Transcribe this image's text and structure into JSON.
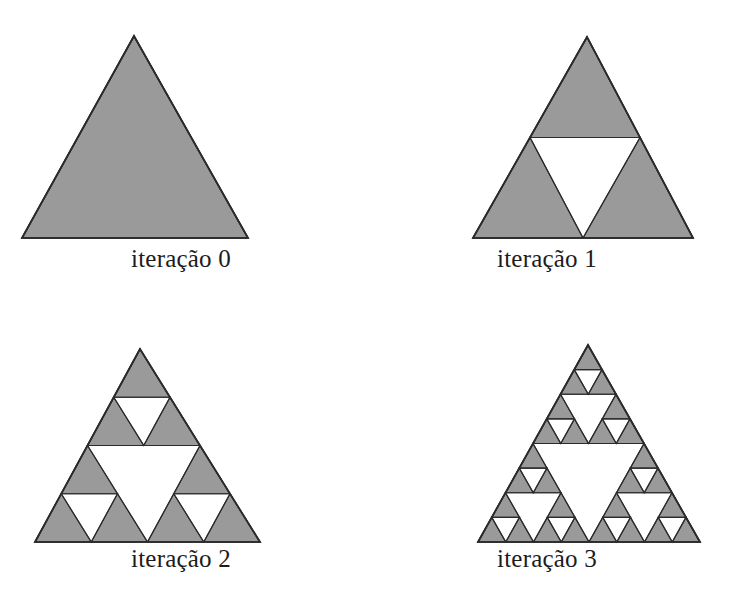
{
  "figure": {
    "background_color": "#ffffff",
    "fill_color": "#9a9a9a",
    "stroke_color": "#2b2b2b",
    "hole_color": "#ffffff",
    "panels": [
      {
        "caption": "iteração 0",
        "iteration": 0,
        "depth": 0,
        "apex": [
          134,
          36
        ],
        "left": [
          22,
          238
        ],
        "right": [
          248,
          238
        ],
        "filled_triangles": 1,
        "holes": 0
      },
      {
        "caption": "iteração 1",
        "iteration": 1,
        "depth": 1,
        "apex": [
          222,
          37
        ],
        "left": [
          108,
          238
        ],
        "right": [
          328,
          238
        ],
        "filled_triangles": 3,
        "holes": 1
      },
      {
        "caption": "iteração 2",
        "iteration": 2,
        "depth": 2,
        "apex": [
          140,
          46
        ],
        "left": [
          35,
          239
        ],
        "right": [
          260,
          239
        ],
        "filled_triangles": 9,
        "holes": 4
      },
      {
        "caption": "iteração 3",
        "iteration": 3,
        "depth": 3,
        "apex": [
          223,
          42
        ],
        "left": [
          113,
          239
        ],
        "right": [
          335,
          239
        ],
        "filled_triangles": 27,
        "holes": 13
      }
    ]
  },
  "chart_data": {
    "type": "diagram",
    "categories": [
      "iteração 0",
      "iteração 1",
      "iteração 2",
      "iteração 3"
    ],
    "series": [
      {
        "name": "filled triangles",
        "values": [
          1,
          3,
          9,
          27
        ]
      },
      {
        "name": "holes (removed triangles)",
        "values": [
          0,
          1,
          4,
          13
        ]
      }
    ],
    "xlabel": "",
    "ylabel": "",
    "legend": "none",
    "grid": false
  }
}
